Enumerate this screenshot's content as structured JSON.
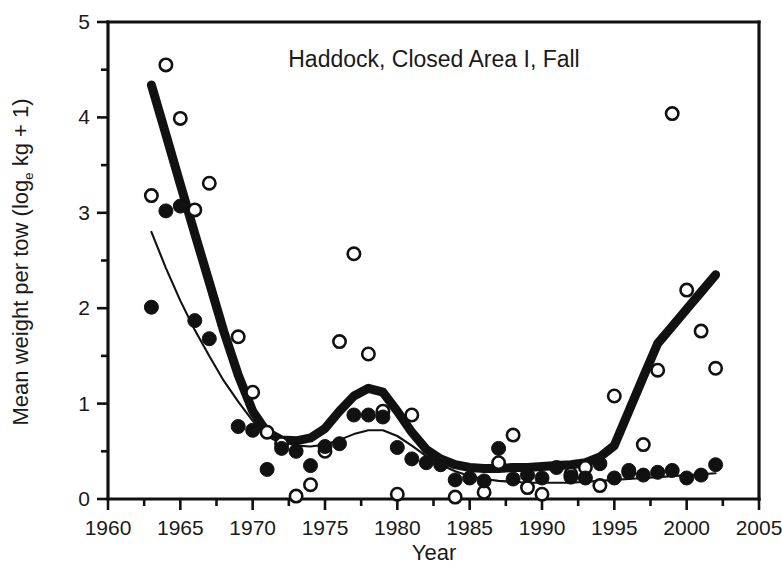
{
  "chart_data": {
    "type": "scatter",
    "title": "Haddock, Closed Area I, Fall",
    "xlabel": "Year",
    "ylabel": "Mean weight per tow (log",
    "ylabel_sub": "e",
    "ylabel_tail": " kg + 1)",
    "xlim": [
      1960,
      2005
    ],
    "ylim": [
      0,
      5
    ],
    "xticks": [
      1960,
      1965,
      1970,
      1975,
      1980,
      1985,
      1990,
      1995,
      2000,
      2005
    ],
    "xtick_labels": [
      "1960",
      "1965",
      "1970",
      "1975",
      "1980",
      "1985",
      "1990",
      "1995",
      "2000",
      "2005"
    ],
    "yticks": [
      0,
      1,
      2,
      3,
      4,
      5
    ],
    "ytick_labels": [
      "0",
      "1",
      "2",
      "3",
      "4",
      "5"
    ],
    "xtick_minor_step": 2.5,
    "grid": false,
    "legend": "none",
    "series": [
      {
        "name": "open-circles",
        "marker": "open-circle",
        "color": "#111111",
        "points": [
          [
            1963,
            3.18
          ],
          [
            1964,
            4.55
          ],
          [
            1965,
            3.99
          ],
          [
            1966,
            3.03
          ],
          [
            1967,
            3.31
          ],
          [
            1969,
            1.7
          ],
          [
            1970,
            1.12
          ],
          [
            1971,
            0.7
          ],
          [
            1972,
            0.58
          ],
          [
            1973,
            0.03
          ],
          [
            1974,
            0.15
          ],
          [
            1975,
            0.5
          ],
          [
            1976,
            1.65
          ],
          [
            1977,
            2.57
          ],
          [
            1978,
            1.52
          ],
          [
            1979,
            0.92
          ],
          [
            1980,
            0.05
          ],
          [
            1981,
            0.88
          ],
          [
            1983,
            0.38
          ],
          [
            1984,
            0.02
          ],
          [
            1986,
            0.07
          ],
          [
            1987,
            0.38
          ],
          [
            1988,
            0.67
          ],
          [
            1989,
            0.12
          ],
          [
            1990,
            0.05
          ],
          [
            1992,
            0.26
          ],
          [
            1993,
            0.33
          ],
          [
            1994,
            0.14
          ],
          [
            1995,
            1.08
          ],
          [
            1996,
            0.28
          ],
          [
            1997,
            0.57
          ],
          [
            1998,
            1.35
          ],
          [
            1999,
            4.04
          ],
          [
            2000,
            2.19
          ],
          [
            2001,
            1.76
          ],
          [
            2002,
            1.37
          ]
        ]
      },
      {
        "name": "closed-circles",
        "marker": "closed-circle",
        "color": "#111111",
        "points": [
          [
            1963,
            2.01
          ],
          [
            1964,
            3.02
          ],
          [
            1965,
            3.07
          ],
          [
            1966,
            1.87
          ],
          [
            1967,
            1.68
          ],
          [
            1969,
            0.76
          ],
          [
            1970,
            0.72
          ],
          [
            1971,
            0.31
          ],
          [
            1972,
            0.53
          ],
          [
            1973,
            0.5
          ],
          [
            1974,
            0.35
          ],
          [
            1975,
            0.55
          ],
          [
            1976,
            0.58
          ],
          [
            1977,
            0.88
          ],
          [
            1978,
            0.88
          ],
          [
            1979,
            0.86
          ],
          [
            1980,
            0.54
          ],
          [
            1981,
            0.42
          ],
          [
            1982,
            0.38
          ],
          [
            1983,
            0.36
          ],
          [
            1984,
            0.2
          ],
          [
            1985,
            0.22
          ],
          [
            1986,
            0.19
          ],
          [
            1987,
            0.53
          ],
          [
            1988,
            0.21
          ],
          [
            1989,
            0.25
          ],
          [
            1990,
            0.22
          ],
          [
            1991,
            0.33
          ],
          [
            1992,
            0.23
          ],
          [
            1993,
            0.22
          ],
          [
            1994,
            0.37
          ],
          [
            1995,
            0.22
          ],
          [
            1996,
            0.3
          ],
          [
            1997,
            0.25
          ],
          [
            1998,
            0.28
          ],
          [
            1999,
            0.3
          ],
          [
            2000,
            0.22
          ],
          [
            2001,
            0.25
          ],
          [
            2002,
            0.36
          ]
        ]
      }
    ],
    "trend_lines": [
      {
        "name": "thick-trend",
        "width": "thick",
        "points": [
          [
            1963,
            4.34
          ],
          [
            1964,
            3.82
          ],
          [
            1965,
            3.3
          ],
          [
            1966,
            2.78
          ],
          [
            1967,
            2.27
          ],
          [
            1968,
            1.76
          ],
          [
            1969,
            1.3
          ],
          [
            1970,
            0.92
          ],
          [
            1971,
            0.7
          ],
          [
            1972,
            0.62
          ],
          [
            1973,
            0.61
          ],
          [
            1974,
            0.64
          ],
          [
            1975,
            0.74
          ],
          [
            1976,
            0.92
          ],
          [
            1977,
            1.08
          ],
          [
            1978,
            1.16
          ],
          [
            1979,
            1.12
          ],
          [
            1980,
            0.92
          ],
          [
            1981,
            0.7
          ],
          [
            1982,
            0.52
          ],
          [
            1983,
            0.42
          ],
          [
            1984,
            0.36
          ],
          [
            1985,
            0.33
          ],
          [
            1986,
            0.32
          ],
          [
            1987,
            0.32
          ],
          [
            1988,
            0.33
          ],
          [
            1989,
            0.33
          ],
          [
            1990,
            0.34
          ],
          [
            1991,
            0.35
          ],
          [
            1992,
            0.36
          ],
          [
            1993,
            0.38
          ],
          [
            1994,
            0.44
          ],
          [
            1995,
            0.56
          ],
          [
            1996,
            0.92
          ],
          [
            1997,
            1.28
          ],
          [
            1998,
            1.63
          ],
          [
            1999,
            1.81
          ],
          [
            2000,
            1.99
          ],
          [
            2001,
            2.17
          ],
          [
            2002,
            2.35
          ]
        ]
      },
      {
        "name": "thin-trend",
        "width": "thin",
        "points": [
          [
            1963,
            2.8
          ],
          [
            1964,
            2.42
          ],
          [
            1965,
            2.08
          ],
          [
            1966,
            1.77
          ],
          [
            1967,
            1.5
          ],
          [
            1968,
            1.24
          ],
          [
            1969,
            1.02
          ],
          [
            1970,
            0.82
          ],
          [
            1971,
            0.68
          ],
          [
            1972,
            0.6
          ],
          [
            1973,
            0.56
          ],
          [
            1974,
            0.55
          ],
          [
            1975,
            0.57
          ],
          [
            1976,
            0.62
          ],
          [
            1977,
            0.68
          ],
          [
            1978,
            0.72
          ],
          [
            1979,
            0.72
          ],
          [
            1980,
            0.66
          ],
          [
            1981,
            0.56
          ],
          [
            1982,
            0.45
          ],
          [
            1983,
            0.36
          ],
          [
            1984,
            0.29
          ],
          [
            1985,
            0.24
          ],
          [
            1986,
            0.21
          ],
          [
            1987,
            0.19
          ],
          [
            1988,
            0.18
          ],
          [
            1989,
            0.17
          ],
          [
            1990,
            0.17
          ],
          [
            1991,
            0.17
          ],
          [
            1992,
            0.17
          ],
          [
            1993,
            0.18
          ],
          [
            1994,
            0.19
          ],
          [
            1995,
            0.2
          ],
          [
            1996,
            0.21
          ],
          [
            1997,
            0.22
          ],
          [
            1998,
            0.23
          ],
          [
            1999,
            0.24
          ],
          [
            2000,
            0.25
          ],
          [
            2001,
            0.26
          ],
          [
            2002,
            0.27
          ]
        ]
      }
    ]
  }
}
